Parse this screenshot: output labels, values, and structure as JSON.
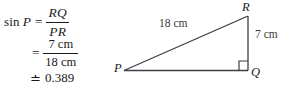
{
  "equation": {
    "line1": {
      "function_name": "sin",
      "angle_variable": "P",
      "relation": "=",
      "fraction": {
        "numerator": "RQ",
        "denominator": "PR"
      }
    },
    "line2": {
      "relation": "=",
      "fraction": {
        "numerator": "7 cm",
        "denominator": "18 cm"
      }
    },
    "line3": {
      "relation": "≐",
      "value": "0.389"
    }
  },
  "figure": {
    "type": "right-triangle",
    "vertices": {
      "P": "P",
      "Q": "Q",
      "R": "R"
    },
    "side_labels": {
      "hypotenuse_PR": "18 cm",
      "opposite_RQ": "7 cm"
    },
    "right_angle_at": "Q",
    "colors": {
      "stroke": "#3d3d44",
      "text": "#1a1a1a",
      "label_text": "#3a3a3a",
      "background": "#ffffff"
    }
  }
}
